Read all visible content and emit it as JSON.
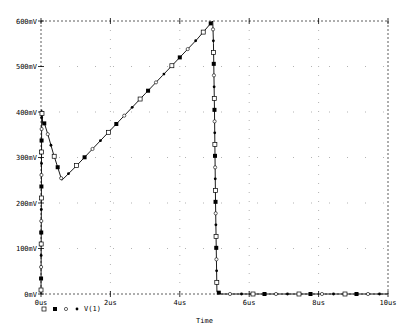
{
  "chart_data": {
    "type": "line",
    "title": "",
    "xlabel": "Time",
    "ylabel": "",
    "xlim": [
      0,
      10
    ],
    "ylim": [
      0,
      600
    ],
    "x_unit": "us",
    "y_unit": "mV",
    "x_ticks": [
      "0us",
      "2us",
      "4us",
      "6us",
      "8us",
      "10us"
    ],
    "y_ticks": [
      "0mV",
      "100mV",
      "200mV",
      "300mV",
      "400mV",
      "500mV",
      "600mV"
    ],
    "grid": true,
    "legend_position": "bottom-left",
    "series": [
      {
        "name": "V(1)",
        "x": [
          0,
          0.02,
          0.05,
          0.1,
          0.2,
          0.35,
          0.6,
          1.0,
          1.5,
          2.0,
          2.5,
          3.0,
          3.5,
          4.0,
          4.5,
          4.95,
          4.97,
          5.0,
          5.03,
          5.07,
          5.2,
          6.0,
          7.0,
          8.0,
          9.0,
          10.0
        ],
        "y": [
          0,
          405,
          375,
          375,
          350,
          310,
          250,
          280,
          320,
          360,
          400,
          440,
          480,
          520,
          560,
          600,
          550,
          400,
          200,
          5,
          0,
          0,
          0,
          0,
          0,
          0
        ]
      }
    ]
  },
  "legend": {
    "markers": [
      "open-square",
      "filled-square",
      "open-circle",
      "filled-circle"
    ],
    "label": "V(1)"
  },
  "axis": {
    "x_title": "Time"
  },
  "colors": {
    "trace": "#000000",
    "grid": "#7f7f7f",
    "background": "#ffffff"
  }
}
